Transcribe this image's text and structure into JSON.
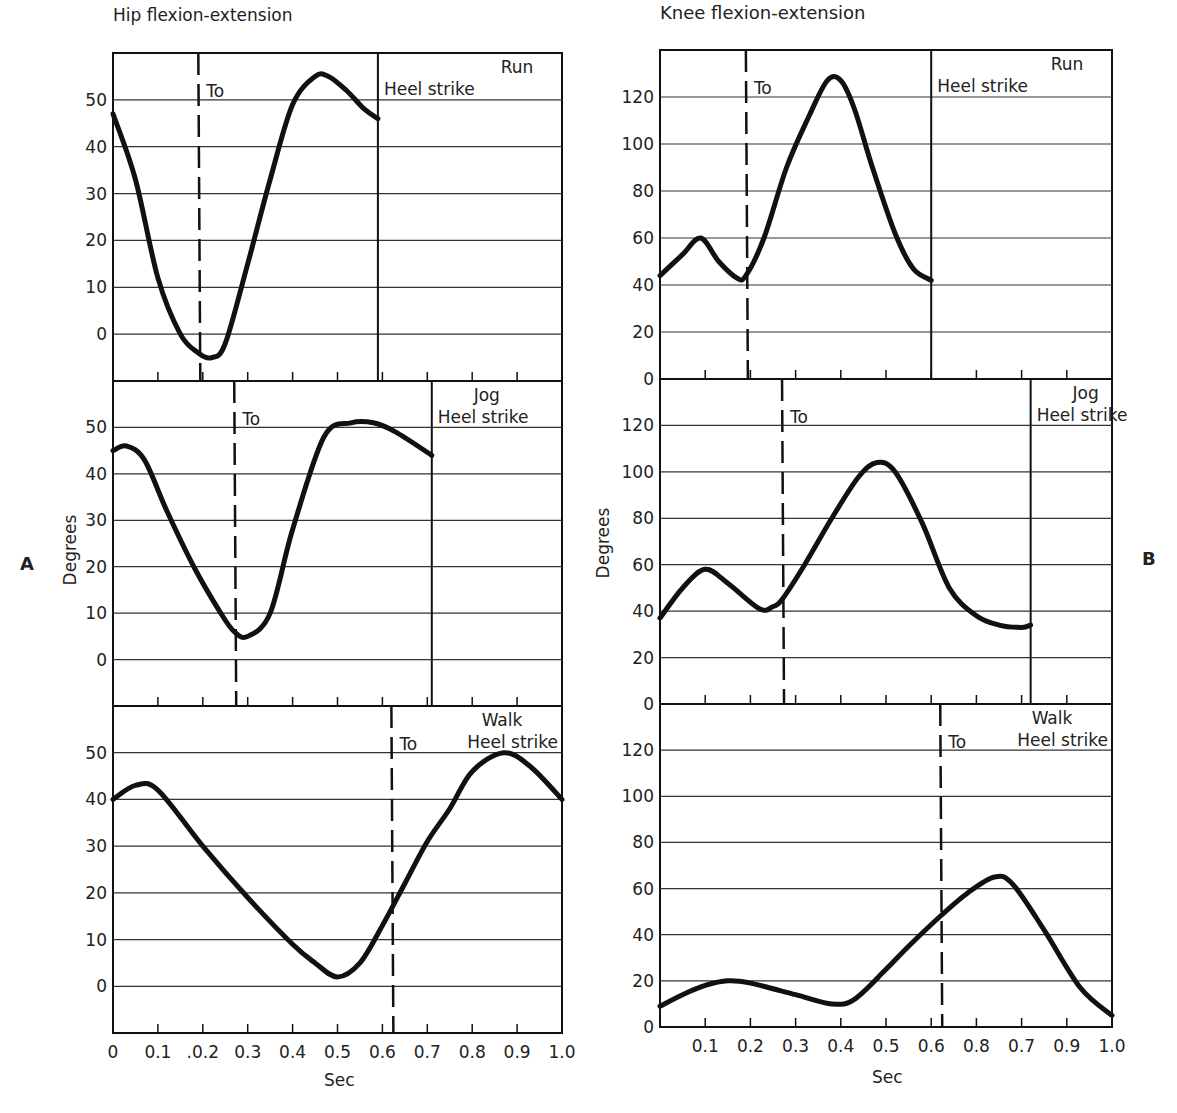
{
  "chart_data": [
    {
      "type": "line",
      "panel_group": "A",
      "title": "Hip flexion-extension",
      "xlabel": "Sec",
      "ylabel": "Degrees",
      "x_ticks": [
        "0",
        "0.1",
        ".0.2",
        "0.3",
        "0.4",
        "0.5",
        "0.6",
        "0.7",
        "0.8",
        "0.9",
        "1.0"
      ],
      "y_ticks": [
        "0",
        "10",
        "20",
        "30",
        "40",
        "50"
      ],
      "ylim": [
        -10,
        60
      ],
      "xlim": [
        0,
        1.0
      ],
      "panels": [
        {
          "name": "Run",
          "toe_off": 0.19,
          "heel_strike": 0.59,
          "x": [
            0,
            0.05,
            0.1,
            0.15,
            0.19,
            0.22,
            0.25,
            0.3,
            0.35,
            0.4,
            0.45,
            0.48,
            0.52,
            0.56,
            0.59
          ],
          "y": [
            47,
            33,
            12,
            0,
            -4,
            -5,
            -2,
            15,
            33,
            49,
            55,
            55,
            52,
            48,
            46
          ]
        },
        {
          "name": "Jog",
          "toe_off": 0.27,
          "heel_strike": 0.71,
          "x": [
            0,
            0.03,
            0.07,
            0.12,
            0.18,
            0.24,
            0.27,
            0.3,
            0.35,
            0.4,
            0.47,
            0.53,
            0.58,
            0.63,
            0.71
          ],
          "y": [
            45,
            46,
            43,
            32,
            20,
            10,
            6,
            5,
            10,
            28,
            48,
            51,
            51,
            49,
            44
          ]
        },
        {
          "name": "Walk",
          "toe_off": 0.62,
          "heel_strike": 1.0,
          "x": [
            0,
            0.05,
            0.1,
            0.2,
            0.3,
            0.4,
            0.45,
            0.5,
            0.55,
            0.6,
            0.65,
            0.7,
            0.75,
            0.8,
            0.87,
            0.93,
            1.0
          ],
          "y": [
            40,
            43,
            42,
            30,
            19,
            9,
            5,
            2,
            5,
            13,
            22,
            31,
            38,
            46,
            50,
            47,
            40
          ]
        }
      ]
    },
    {
      "type": "line",
      "panel_group": "B",
      "title": "Knee flexion-extension",
      "xlabel": "Sec",
      "ylabel": "Degrees",
      "x_ticks": [
        "0.1",
        "0.2",
        "0.3",
        "0.4",
        "0.5",
        "0.6",
        "0.8",
        "0.7",
        "0.9",
        "1.0"
      ],
      "y_ticks": [
        "0",
        "20",
        "40",
        "60",
        "80",
        "100",
        "120"
      ],
      "ylim": [
        0,
        140
      ],
      "xlim": [
        0,
        1.0
      ],
      "panels": [
        {
          "name": "Run",
          "toe_off": 0.19,
          "heel_strike": 0.6,
          "x": [
            0,
            0.05,
            0.09,
            0.13,
            0.17,
            0.19,
            0.23,
            0.28,
            0.33,
            0.37,
            0.4,
            0.43,
            0.47,
            0.52,
            0.56,
            0.6
          ],
          "y": [
            44,
            53,
            60,
            50,
            43,
            44,
            60,
            90,
            112,
            127,
            127,
            115,
            90,
            62,
            47,
            42
          ]
        },
        {
          "name": "Jog",
          "toe_off": 0.27,
          "heel_strike": 0.82,
          "x": [
            0,
            0.05,
            0.1,
            0.15,
            0.22,
            0.25,
            0.27,
            0.32,
            0.38,
            0.44,
            0.48,
            0.52,
            0.58,
            0.64,
            0.7,
            0.75,
            0.8,
            0.82
          ],
          "y": [
            37,
            50,
            58,
            52,
            41,
            42,
            45,
            60,
            80,
            98,
            104,
            100,
            78,
            50,
            38,
            34,
            33,
            34
          ]
        },
        {
          "name": "Walk",
          "toe_off": 0.62,
          "heel_strike": 1.0,
          "x": [
            0,
            0.05,
            0.1,
            0.15,
            0.2,
            0.3,
            0.38,
            0.43,
            0.5,
            0.55,
            0.62,
            0.68,
            0.74,
            0.78,
            0.85,
            0.93,
            1.0
          ],
          "y": [
            9,
            14,
            18,
            20,
            19,
            14,
            10,
            12,
            25,
            35,
            48,
            58,
            65,
            62,
            42,
            17,
            5
          ]
        }
      ]
    }
  ],
  "labels": {
    "hip_title": "Hip flexion-extension",
    "knee_title": "Knee flexion-extension",
    "run": "Run",
    "jog": "Jog",
    "walk": "Walk",
    "heel_strike": "Heel strike",
    "toe_off": "To",
    "degrees": "Degrees",
    "sec": "Sec",
    "panel_a": "A",
    "panel_b": "B"
  }
}
